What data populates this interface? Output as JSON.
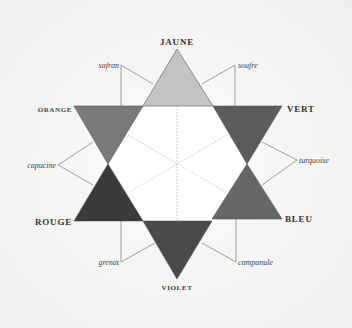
{
  "diagram": {
    "type": "chromatic-star",
    "primary_labels": {
      "jaune": "JAUNE",
      "vert": "VERT",
      "bleu": "BLEU",
      "violet": "VIOLET",
      "rouge": "ROUGE",
      "orange": "ORANGE"
    },
    "intermediate_labels": {
      "safran": "safran",
      "soufre": "soufre",
      "turquoise": "turquoise",
      "campanule": "campanule",
      "grenat": "grenat",
      "capucine": "capucine"
    },
    "colors": {
      "background": "#f6f6f4",
      "jaune": "#c4c4c2",
      "orange": "#7a7a78",
      "vert": "#5c5c5a",
      "rouge": "#3a3a38",
      "bleu": "#666664",
      "violet": "#4a4a48",
      "center": "#ffffff"
    }
  }
}
